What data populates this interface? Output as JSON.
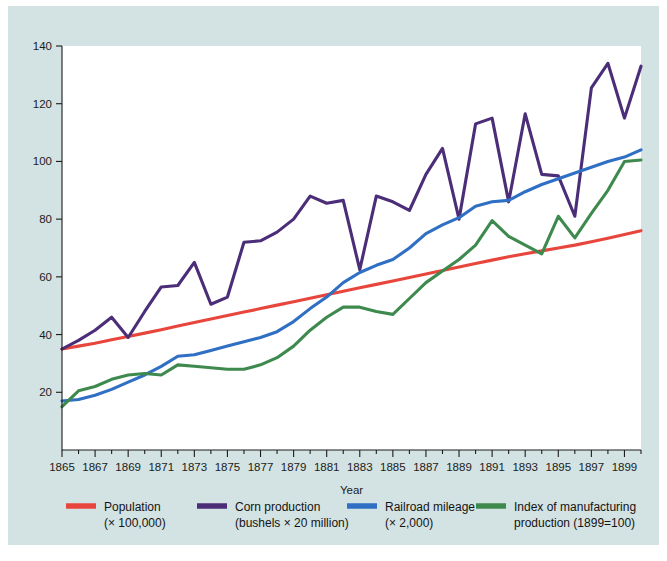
{
  "figure": {
    "background_color": "#d3e2e2",
    "plot_background_color": "#ffffff",
    "axis_color": "#1c1c1c"
  },
  "chart_data": {
    "type": "line",
    "title": "",
    "xlabel": "Year",
    "ylabel": "",
    "xlim": [
      1865,
      1900
    ],
    "ylim": [
      0,
      140
    ],
    "grid": false,
    "legend_position": "bottom",
    "xticks": [
      1865,
      1867,
      1869,
      1871,
      1873,
      1875,
      1877,
      1879,
      1881,
      1883,
      1885,
      1887,
      1889,
      1891,
      1893,
      1895,
      1897,
      1899
    ],
    "xtick_labels": [
      "1865",
      "1867",
      "1869",
      "1871",
      "1873",
      "1875",
      "1877",
      "1879",
      "1881",
      "1883",
      "1885",
      "1887",
      "1889",
      "1891",
      "1893",
      "1895",
      "1897",
      "1899"
    ],
    "xminor_ticks": [
      1866,
      1868,
      1870,
      1872,
      1874,
      1876,
      1878,
      1880,
      1882,
      1884,
      1886,
      1888,
      1890,
      1892,
      1894,
      1896,
      1898,
      1900
    ],
    "yticks": [
      20,
      40,
      60,
      80,
      100,
      120,
      140
    ],
    "ytick_labels": [
      "20",
      "40",
      "60",
      "80",
      "100",
      "120",
      "140"
    ],
    "x": [
      1865,
      1866,
      1867,
      1868,
      1869,
      1870,
      1871,
      1872,
      1873,
      1874,
      1875,
      1876,
      1877,
      1878,
      1879,
      1880,
      1881,
      1882,
      1883,
      1884,
      1885,
      1886,
      1887,
      1888,
      1889,
      1890,
      1891,
      1892,
      1893,
      1894,
      1895,
      1896,
      1897,
      1898,
      1899,
      1900
    ],
    "series": [
      {
        "name": "Population",
        "unit": "(× 100,000)",
        "color": "#e8463c",
        "values": [
          35.0,
          36.0,
          37.0,
          38.2,
          39.3,
          40.5,
          41.7,
          43.0,
          44.2,
          45.4,
          46.6,
          47.8,
          49.0,
          50.2,
          51.4,
          52.6,
          53.8,
          55.0,
          56.2,
          57.4,
          58.6,
          59.8,
          61.0,
          62.2,
          63.4,
          64.6,
          65.8,
          67.0,
          68.0,
          69.0,
          70.0,
          71.0,
          72.2,
          73.4,
          74.7,
          76.0
        ]
      },
      {
        "name": "Corn production",
        "unit": "(bushels × 20 million)",
        "color": "#4b2d78",
        "values": [
          35.0,
          38.0,
          41.5,
          46.0,
          39.0,
          48.0,
          56.5,
          57.0,
          65.0,
          50.5,
          53.0,
          72.0,
          72.5,
          75.5,
          80.0,
          88.0,
          85.5,
          86.5,
          62.5,
          88.0,
          86.0,
          83.0,
          95.5,
          104.5,
          80.0,
          113.0,
          115.0,
          86.0,
          116.5,
          95.5,
          95.0,
          81.0,
          125.5,
          134.0,
          115.0,
          133.0
        ]
      },
      {
        "name": "Railroad mileage",
        "unit": "(× 2,000)",
        "color": "#2f6fc4",
        "values": [
          17.0,
          17.5,
          19.0,
          21.0,
          23.5,
          26.0,
          29.0,
          32.5,
          33.0,
          34.5,
          36.0,
          37.5,
          39.0,
          41.0,
          44.5,
          49.0,
          53.0,
          58.0,
          61.5,
          64.0,
          66.0,
          70.0,
          75.0,
          78.0,
          80.5,
          84.5,
          86.0,
          86.5,
          89.5,
          92.0,
          94.0,
          96.0,
          98.0,
          100.0,
          101.5,
          104.0
        ]
      },
      {
        "name": "Index of manufacturing production",
        "unit": "(1899=100)",
        "color": "#3e8a4e",
        "values": [
          15.0,
          20.5,
          22.0,
          24.5,
          26.0,
          26.5,
          26.0,
          29.5,
          29.0,
          28.5,
          28.0,
          28.0,
          29.5,
          32.0,
          36.0,
          41.5,
          46.0,
          49.5,
          49.5,
          48.0,
          47.0,
          52.5,
          58.0,
          62.0,
          66.0,
          71.0,
          79.5,
          74.0,
          71.0,
          68.0,
          81.0,
          73.5,
          82.0,
          90.0,
          100.0,
          100.5
        ]
      }
    ]
  },
  "legend": {
    "items": [
      {
        "label": "Population",
        "sublabel": "(× 100,000)",
        "color": "#e8463c",
        "swatch_name": "legend-swatch-population"
      },
      {
        "label": "Corn production",
        "sublabel": "(bushels × 20 million)",
        "color": "#4b2d78",
        "swatch_name": "legend-swatch-corn-production"
      },
      {
        "label": "Railroad mileage",
        "sublabel": "(× 2,000)",
        "color": "#2f6fc4",
        "swatch_name": "legend-swatch-railroad-mileage"
      },
      {
        "label": "Index of manufacturing",
        "sublabel": "production (1899=100)",
        "color": "#3e8a4e",
        "swatch_name": "legend-swatch-manufacturing-index"
      }
    ]
  }
}
